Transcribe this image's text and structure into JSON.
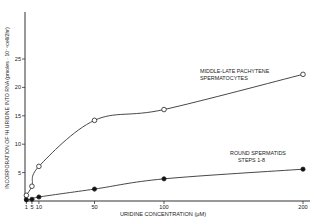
{
  "chart_data": {
    "type": "line",
    "title": "",
    "xlabel": "URIDINE CONCENTRATION (μM)",
    "ylabel": "INCORPORATION OF ³H URIDINE INTO RNA (pmoles · 10⁻⁶cell/2hr)",
    "x_ticks": [
      1,
      5,
      10,
      50,
      100,
      200
    ],
    "x_tick_labels": [
      "1",
      "5",
      "10",
      "50",
      "100",
      "200"
    ],
    "y_ticks": [
      5,
      10,
      15,
      20,
      25
    ],
    "y_tick_labels": [
      "5",
      "10",
      "15",
      "20",
      "25"
    ],
    "xlim": [
      0,
      200
    ],
    "ylim": [
      0,
      30
    ],
    "grid": false,
    "legend_position": "inline annotations",
    "x": [
      1,
      5,
      10,
      50,
      100,
      200
    ],
    "series": [
      {
        "name": "MIDDLE-LATE PACHYTENE SPERMATOCYTES",
        "marker": "open-circle",
        "values": [
          1.0,
          2.6,
          6.1,
          14.2,
          16.1,
          22.3
        ]
      },
      {
        "name": "ROUND SPERMATIDS STEPS 1-8",
        "marker": "filled-circle",
        "values": [
          0.2,
          0.3,
          0.7,
          2.1,
          3.9,
          5.6
        ]
      }
    ],
    "annotations": [
      {
        "text": "MIDDLE-LATE PACHYTENE",
        "series": 0
      },
      {
        "text": "SPERMATOCYTES",
        "series": 0
      },
      {
        "text": "ROUND SPERMATIDS",
        "series": 1
      },
      {
        "text": "STEPS 1-8",
        "series": 1
      }
    ]
  },
  "labels": {
    "xlabel": "URIDINE CONCENTRATION (μM)",
    "ylabel": "INCORPORATION OF ³H URIDINE INTO RNA (pmoles · 10⁻⁶cell/2hr)",
    "series0_line1": "MIDDLE-LATE PACHYTENE",
    "series0_line2": "SPERMATOCYTES",
    "series1_line1": "ROUND SPERMATIDS",
    "series1_line2": "STEPS 1-8"
  }
}
